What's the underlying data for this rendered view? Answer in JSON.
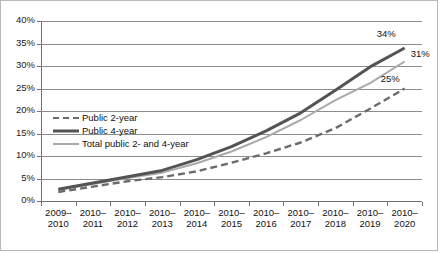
{
  "chart_data": {
    "type": "line",
    "title": "",
    "subtitle": "",
    "xlabel": "",
    "ylabel": "",
    "ylim": [
      0,
      40
    ],
    "ytick_labels": [
      "0%",
      "5%",
      "10%",
      "15%",
      "20%",
      "25%",
      "30%",
      "35%",
      "40%"
    ],
    "ytick_values": [
      0,
      5,
      10,
      15,
      20,
      25,
      30,
      35,
      40
    ],
    "grid": true,
    "legend_position": "inside-upper-left",
    "categories": [
      "2009–2010",
      "2010–2011",
      "2010–2012",
      "2010–2013",
      "2010–2014",
      "2010–2015",
      "2010–2016",
      "2010–2017",
      "2010–2018",
      "2010–2019",
      "2010–2020"
    ],
    "category_lines": [
      [
        "2009–",
        "2010"
      ],
      [
        "2010–",
        "2011"
      ],
      [
        "2010–",
        "2012"
      ],
      [
        "2010–",
        "2013"
      ],
      [
        "2010–",
        "2014"
      ],
      [
        "2010–",
        "2015"
      ],
      [
        "2010–",
        "2016"
      ],
      [
        "2010–",
        "2017"
      ],
      [
        "2010–",
        "2018"
      ],
      [
        "2010–",
        "2019"
      ],
      [
        "2010–",
        "2020"
      ]
    ],
    "series": [
      {
        "name": "Public 2-year",
        "style": "dashed",
        "color": "#6b6b6b",
        "values": [
          2.0,
          3.2,
          4.4,
          5.3,
          6.6,
          8.5,
          10.6,
          13.0,
          16.2,
          20.5,
          25.0
        ],
        "end_label": "25%"
      },
      {
        "name": "Public 4-year",
        "style": "solid-thick",
        "color": "#545454",
        "values": [
          2.6,
          4.0,
          5.4,
          6.8,
          9.2,
          12.1,
          15.6,
          19.6,
          24.6,
          29.8,
          34.0
        ],
        "end_label": "34%"
      },
      {
        "name": "Total public 2- and 4-year",
        "style": "solid-thin",
        "color": "#a9a9a9",
        "values": [
          2.5,
          3.8,
          5.1,
          6.3,
          8.4,
          11.0,
          14.2,
          18.0,
          22.4,
          26.2,
          31.0
        ],
        "end_label": "31%"
      }
    ],
    "end_labels": [
      {
        "text": "34%",
        "series": "Public 4-year"
      },
      {
        "text": "31%",
        "series": "Total public 2- and 4-year"
      },
      {
        "text": "25%",
        "series": "Public 2-year"
      }
    ],
    "colors": {
      "public_2year": "#6b6b6b",
      "public_4year": "#545454",
      "total_public": "#a9a9a9",
      "grid": "#8d8d8d",
      "axis": "#6f6f6f",
      "text": "#111111",
      "border": "#b8b8b8",
      "background": "#ffffff"
    },
    "legend": [
      {
        "label": "Public 2-year",
        "style": "dashed"
      },
      {
        "label": "Public 4-year",
        "style": "solid-thick"
      },
      {
        "label": "Total public 2- and 4-year",
        "style": "solid-thin"
      }
    ]
  }
}
